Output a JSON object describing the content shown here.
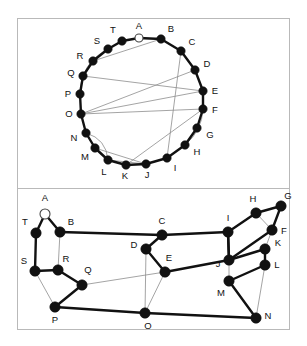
{
  "figure": {
    "panels": [
      {
        "name": "circular-layout-panel",
        "layout": "circular",
        "description": "20 vertices arranged on a circle with chords drawn inside"
      },
      {
        "name": "planar-layout-panel",
        "layout": "straight-line-drawing",
        "description": "Same 20 vertices laid out as a straight-line drawing"
      }
    ],
    "colors": {
      "background": "#ffffff",
      "frame": "#b9b9b9",
      "node_fill": "#111111",
      "node_open_fill": "#ffffff",
      "edge_thick": "#111111",
      "edge_thin": "#8d8d8d",
      "label": "#111111"
    },
    "node_labels": [
      "A",
      "B",
      "C",
      "D",
      "E",
      "F",
      "G",
      "H",
      "I",
      "J",
      "K",
      "L",
      "M",
      "N",
      "O",
      "P",
      "Q",
      "R",
      "S",
      "T"
    ],
    "open_node": "A"
  },
  "circle_graph": {
    "name": "top-circular-graph",
    "center": [
      150,
      105
    ],
    "radius": 64,
    "nodes": [
      {
        "id": "A",
        "x": 139.0,
        "y": 38.0,
        "lx": 139.0,
        "ly": 26.0,
        "open": true
      },
      {
        "id": "B",
        "x": 161.0,
        "y": 39.0,
        "lx": 171.0,
        "ly": 29.0,
        "open": false
      },
      {
        "id": "C",
        "x": 181.0,
        "y": 51.0,
        "lx": 192.0,
        "ly": 42.0,
        "open": false
      },
      {
        "id": "D",
        "x": 195.0,
        "y": 70.0,
        "lx": 207.0,
        "ly": 64.0,
        "open": false
      },
      {
        "id": "E",
        "x": 203.0,
        "y": 91.0,
        "lx": 215.0,
        "ly": 91.0,
        "open": false
      },
      {
        "id": "F",
        "x": 203.0,
        "y": 109.0,
        "lx": 215.0,
        "ly": 110.0,
        "open": false
      },
      {
        "id": "G",
        "x": 197.0,
        "y": 128.0,
        "lx": 210.0,
        "ly": 135.0,
        "open": false
      },
      {
        "id": "H",
        "x": 185.0,
        "y": 145.0,
        "lx": 197.0,
        "ly": 152.0,
        "open": false
      },
      {
        "id": "I",
        "x": 167.0,
        "y": 158.0,
        "lx": 175.0,
        "ly": 168.0,
        "open": false
      },
      {
        "id": "J",
        "x": 146.0,
        "y": 164.0,
        "lx": 147.0,
        "ly": 175.0,
        "open": false
      },
      {
        "id": "K",
        "x": 126.0,
        "y": 165.0,
        "lx": 125.0,
        "ly": 176.0,
        "open": false
      },
      {
        "id": "L",
        "x": 108.0,
        "y": 160.0,
        "lx": 104.0,
        "ly": 172.0,
        "open": false
      },
      {
        "id": "M",
        "x": 95.0,
        "y": 148.0,
        "lx": 85.0,
        "ly": 157.0,
        "open": false
      },
      {
        "id": "N",
        "x": 86.0,
        "y": 133.0,
        "lx": 74.0,
        "ly": 138.0,
        "open": false
      },
      {
        "id": "O",
        "x": 81.0,
        "y": 114.0,
        "lx": 69.0,
        "ly": 114.0,
        "open": false
      },
      {
        "id": "P",
        "x": 80.0,
        "y": 94.0,
        "lx": 68.0,
        "ly": 94.0,
        "open": false
      },
      {
        "id": "Q",
        "x": 83.0,
        "y": 76.0,
        "lx": 71.0,
        "ly": 73.0,
        "open": false
      },
      {
        "id": "R",
        "x": 93.0,
        "y": 61.0,
        "lx": 80.0,
        "ly": 56.0,
        "open": false
      },
      {
        "id": "S",
        "x": 108.0,
        "y": 49.0,
        "lx": 97.0,
        "ly": 41.0,
        "open": false
      },
      {
        "id": "T",
        "x": 122.0,
        "y": 41.0,
        "lx": 113.0,
        "ly": 30.0,
        "open": false
      }
    ],
    "rim_edges": [
      [
        "A",
        "B"
      ],
      [
        "B",
        "C"
      ],
      [
        "C",
        "D"
      ],
      [
        "D",
        "E"
      ],
      [
        "E",
        "F"
      ],
      [
        "F",
        "G"
      ],
      [
        "G",
        "H"
      ],
      [
        "H",
        "I"
      ],
      [
        "I",
        "J"
      ],
      [
        "J",
        "K"
      ],
      [
        "K",
        "L"
      ],
      [
        "L",
        "M"
      ],
      [
        "M",
        "N"
      ],
      [
        "N",
        "O"
      ],
      [
        "O",
        "P"
      ],
      [
        "P",
        "Q"
      ],
      [
        "Q",
        "R"
      ],
      [
        "R",
        "S"
      ],
      [
        "S",
        "T"
      ],
      [
        "T",
        "A"
      ]
    ],
    "chords_straight": [
      [
        "A",
        "B"
      ],
      [
        "B",
        "R"
      ],
      [
        "C",
        "I"
      ],
      [
        "E",
        "Q"
      ],
      [
        "E",
        "O"
      ],
      [
        "D",
        "O"
      ],
      [
        "F",
        "O"
      ],
      [
        "F",
        "K"
      ],
      [
        "M",
        "J"
      ],
      [
        "L",
        "J"
      ]
    ],
    "chords_curved": [
      {
        "from": "S",
        "to": "P",
        "bow": 16
      },
      {
        "from": "F",
        "to": "H",
        "bow": -9
      },
      {
        "from": "N",
        "to": "L",
        "bow": -12
      }
    ]
  },
  "planar_graph": {
    "name": "bottom-planar-graph",
    "nodes": [
      {
        "id": "A",
        "x": 45.0,
        "y": 214.0,
        "lx": 45.0,
        "ly": 198.0,
        "open": true
      },
      {
        "id": "B",
        "x": 60.0,
        "y": 232.0,
        "lx": 71.0,
        "ly": 222.0,
        "open": false
      },
      {
        "id": "C",
        "x": 162.0,
        "y": 235.0,
        "lx": 162.0,
        "ly": 221.0,
        "open": false
      },
      {
        "id": "D",
        "x": 146.0,
        "y": 249.0,
        "lx": 134.0,
        "ly": 245.0,
        "open": false
      },
      {
        "id": "E",
        "x": 165.0,
        "y": 272.0,
        "lx": 169.0,
        "ly": 258.0,
        "open": false
      },
      {
        "id": "F",
        "x": 272.0,
        "y": 230.0,
        "lx": 284.0,
        "ly": 231.0,
        "open": false
      },
      {
        "id": "G",
        "x": 281.0,
        "y": 206.0,
        "lx": 288.0,
        "ly": 196.0,
        "open": false
      },
      {
        "id": "H",
        "x": 256.0,
        "y": 213.0,
        "lx": 253.0,
        "ly": 199.0,
        "open": false
      },
      {
        "id": "I",
        "x": 228.0,
        "y": 232.0,
        "lx": 228.0,
        "ly": 218.0,
        "open": false
      },
      {
        "id": "J",
        "x": 229.0,
        "y": 260.0,
        "lx": 218.0,
        "ly": 264.0,
        "open": false
      },
      {
        "id": "K",
        "x": 265.0,
        "y": 249.0,
        "lx": 278.0,
        "ly": 243.0,
        "open": false
      },
      {
        "id": "L",
        "x": 265.0,
        "y": 265.0,
        "lx": 277.0,
        "ly": 265.0,
        "open": false
      },
      {
        "id": "M",
        "x": 229.0,
        "y": 281.0,
        "lx": 221.0,
        "ly": 293.0,
        "open": false
      },
      {
        "id": "N",
        "x": 256.0,
        "y": 318.0,
        "lx": 268.0,
        "ly": 316.0,
        "open": false
      },
      {
        "id": "O",
        "x": 145.0,
        "y": 313.0,
        "lx": 148.0,
        "ly": 326.0,
        "open": false
      },
      {
        "id": "P",
        "x": 55.0,
        "y": 307.0,
        "lx": 55.0,
        "ly": 320.0,
        "open": false
      },
      {
        "id": "Q",
        "x": 82.0,
        "y": 285.0,
        "lx": 88.0,
        "ly": 270.0,
        "open": false
      },
      {
        "id": "R",
        "x": 58.0,
        "y": 270.0,
        "lx": 66.0,
        "ly": 259.0,
        "open": false
      },
      {
        "id": "S",
        "x": 35.0,
        "y": 271.0,
        "lx": 24.0,
        "ly": 261.0,
        "open": false
      },
      {
        "id": "T",
        "x": 36.0,
        "y": 233.0,
        "lx": 25.0,
        "ly": 222.0,
        "open": false
      }
    ],
    "edges_thick": [
      [
        "A",
        "T"
      ],
      [
        "A",
        "B"
      ],
      [
        "B",
        "C"
      ],
      [
        "T",
        "S"
      ],
      [
        "S",
        "R"
      ],
      [
        "R",
        "Q"
      ],
      [
        "Q",
        "P"
      ],
      [
        "P",
        "O"
      ],
      [
        "O",
        "N"
      ],
      [
        "C",
        "D"
      ],
      [
        "D",
        "E"
      ],
      [
        "E",
        "J"
      ],
      [
        "J",
        "I"
      ],
      [
        "I",
        "H"
      ],
      [
        "H",
        "G"
      ],
      [
        "G",
        "F"
      ],
      [
        "J",
        "K"
      ],
      [
        "K",
        "L"
      ],
      [
        "L",
        "M"
      ],
      [
        "M",
        "N"
      ],
      [
        "I",
        "J"
      ],
      [
        "F",
        "J"
      ],
      [
        "I",
        "C"
      ]
    ],
    "edges_thin": [
      [
        "B",
        "R"
      ],
      [
        "S",
        "P"
      ],
      [
        "Q",
        "E"
      ],
      [
        "D",
        "O"
      ],
      [
        "E",
        "O"
      ],
      [
        "C",
        "I"
      ],
      [
        "F",
        "H"
      ],
      [
        "F",
        "K"
      ],
      [
        "K",
        "L"
      ],
      [
        "L",
        "N"
      ],
      [
        "M",
        "J"
      ]
    ]
  }
}
